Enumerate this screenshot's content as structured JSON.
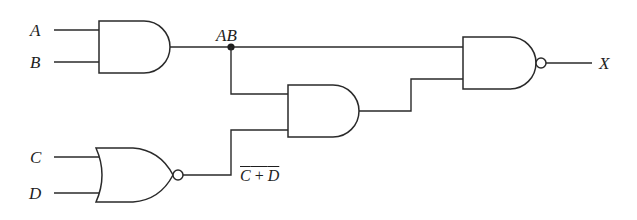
{
  "diagram": {
    "type": "logic-circuit",
    "inputs": [
      {
        "id": "A",
        "label": "A"
      },
      {
        "id": "B",
        "label": "B"
      },
      {
        "id": "C",
        "label": "C"
      },
      {
        "id": "D",
        "label": "D"
      }
    ],
    "output": {
      "id": "X",
      "label": "X"
    },
    "gates": [
      {
        "id": "g1",
        "type": "AND",
        "inputs": [
          "A",
          "B"
        ],
        "output_label": "AB"
      },
      {
        "id": "g2",
        "type": "NOR",
        "inputs": [
          "C",
          "D"
        ],
        "output_label": "C + D",
        "output_overline": true
      },
      {
        "id": "g3",
        "type": "AND",
        "inputs": [
          "AB",
          "NOT(C + D)"
        ]
      },
      {
        "id": "g4",
        "type": "NAND",
        "inputs": [
          "AB",
          "g3"
        ],
        "output": "X"
      }
    ],
    "labels": {
      "A": "A",
      "B": "B",
      "C": "C",
      "D": "D",
      "X": "X",
      "AB": "AB",
      "nor_out_c": "C",
      "nor_out_plus": " + ",
      "nor_out_d": "D"
    },
    "colors": {
      "line": "#2a2a2a",
      "background": "#ffffff"
    }
  }
}
